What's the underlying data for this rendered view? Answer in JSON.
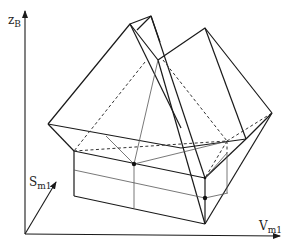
{
  "figure": {
    "type": "3d-polyhedron-diagram",
    "axes": {
      "vertical": {
        "label": "z",
        "subscript": "B"
      },
      "depth": {
        "label": "S",
        "subscript": "m1"
      },
      "horizontal": {
        "label": "V",
        "subscript": "m1"
      }
    },
    "line_styles": {
      "solid_color": "#1a1a1a",
      "thin_color": "#555555",
      "dashed_color": "#333333"
    },
    "marked_points": 3
  }
}
